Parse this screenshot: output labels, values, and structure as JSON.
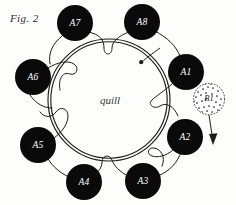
{
  "figure": {
    "caption": "Fig. 2",
    "center_label": "quill",
    "background_color": "#fdfdfb",
    "ink_color": "#1c1c1c",
    "node_fill_color": "#0a0a0a",
    "node_text_color": "#ffffff"
  },
  "ring": {
    "name": "quill-ring",
    "center_x": 109,
    "center_y": 100,
    "outer_radius": 61,
    "inner_radius": 58.5,
    "style": "double-line-circle"
  },
  "direction_arrow": {
    "name": "clockwise-direction-arrow",
    "label": "",
    "tip_x": 141,
    "tip_y": 62
  },
  "nodes": [
    {
      "id": "A1",
      "label": "A1",
      "cx": 186,
      "cy": 72,
      "r": 18,
      "angle_deg": -25
    },
    {
      "id": "A2",
      "label": "A2",
      "cx": 185,
      "cy": 137,
      "r": 18,
      "angle_deg": 30
    },
    {
      "id": "A3",
      "label": "A3",
      "cx": 143,
      "cy": 181,
      "r": 18,
      "angle_deg": 70
    },
    {
      "id": "A4",
      "label": "A4",
      "cx": 84,
      "cy": 182,
      "r": 18,
      "angle_deg": 110
    },
    {
      "id": "A5",
      "label": "A5",
      "cx": 38,
      "cy": 145,
      "r": 18,
      "angle_deg": 150
    },
    {
      "id": "A6",
      "label": "A6",
      "cx": 33,
      "cy": 77,
      "r": 18,
      "angle_deg": 200
    },
    {
      "id": "A7",
      "label": "A7",
      "cx": 75,
      "cy": 23,
      "r": 18,
      "angle_deg": 250
    },
    {
      "id": "A8",
      "label": "A8",
      "cx": 142,
      "cy": 22,
      "r": 18,
      "angle_deg": 290
    }
  ],
  "satellite": {
    "id": "B1",
    "label": "B1",
    "cx": 209,
    "cy": 99,
    "r": 16,
    "fill_style": "stippled",
    "outline_style": "dashed",
    "arrow": {
      "name": "b1-release-arrow",
      "from_x": 209,
      "from_y": 115,
      "to_x": 213,
      "to_y": 143
    }
  }
}
